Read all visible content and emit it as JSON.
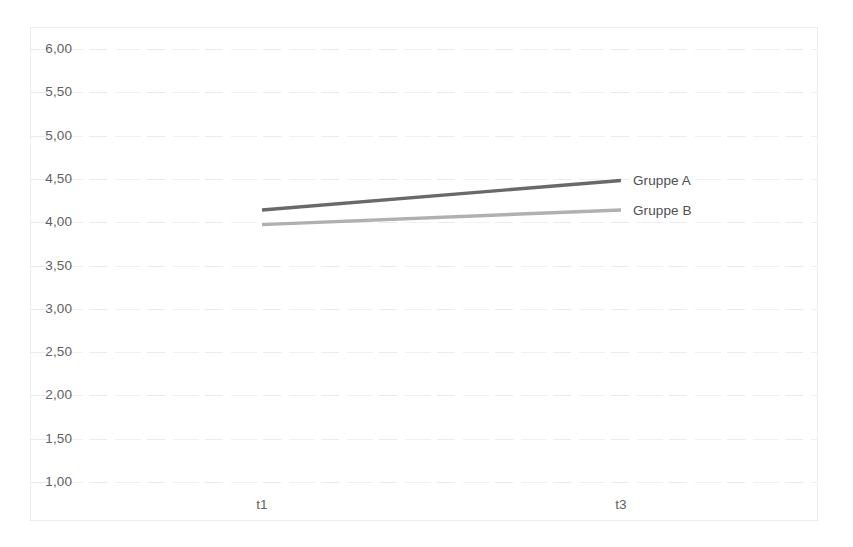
{
  "chart_data": {
    "type": "line",
    "title": "",
    "subtitle": "",
    "xlabel": "",
    "ylabel": "",
    "categories": [
      "t1",
      "t3"
    ],
    "x_tick_labels": [
      "t1",
      "t3"
    ],
    "y_tick_labels": [
      "6,00",
      "5,50",
      "5,00",
      "4,50",
      "4,00",
      "3,50",
      "3,00",
      "2,50",
      "2,00",
      "1,50",
      "1,00"
    ],
    "y_tick_values": [
      6.0,
      5.5,
      5.0,
      4.5,
      4.0,
      3.5,
      3.0,
      2.5,
      2.0,
      1.5,
      1.0
    ],
    "ylim": [
      1.0,
      6.0
    ],
    "y_step": 0.5,
    "grid": true,
    "grid_axis": "y",
    "legend": "series-end-labels",
    "decimal_separator": ",",
    "series": [
      {
        "name": "Gruppe A",
        "values": [
          4.13,
          4.47
        ],
        "color": "#5a5c5e",
        "label_at_end": "Gruppe A"
      },
      {
        "name": "Gruppe B",
        "values": [
          3.96,
          4.13
        ],
        "color": "#a7a9ab",
        "label_at_end": "Gruppe B"
      }
    ]
  },
  "axes": {
    "y_labels": [
      "6,00",
      "5,50",
      "5,00",
      "4,50",
      "4,00",
      "3,50",
      "3,00",
      "2,50",
      "2,00",
      "1,50",
      "1,00"
    ],
    "x_labels": [
      "t1",
      "t3"
    ]
  },
  "legend": {
    "items": [
      {
        "label": "Gruppe A",
        "color": "#5a5c5e"
      },
      {
        "label": "Gruppe B",
        "color": "#a7a9ab"
      }
    ]
  },
  "colors": {
    "series_a": "#5a5c5e",
    "series_b": "#a7a9ab",
    "gridline": "#e9eaec",
    "frame": "#eceded",
    "tick_text": "#5f6163",
    "background": "#ffffff"
  }
}
